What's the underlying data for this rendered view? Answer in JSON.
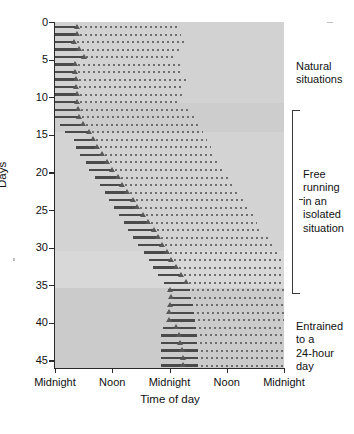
{
  "chart_data": {
    "type": "actogram",
    "title": "",
    "xlabel": "Time of day",
    "ylabel": "Days",
    "xlim": [
      0,
      48
    ],
    "ylim": [
      0,
      46
    ],
    "grid": false,
    "legend": "none",
    "x_tick_values": [
      0,
      12,
      24,
      36,
      48
    ],
    "x_tick_labels": [
      "Midnight",
      "Noon",
      "Midnight",
      "Noon",
      "Midnight"
    ],
    "y_tick_values": [
      0,
      5,
      10,
      15,
      20,
      25,
      30,
      35,
      40,
      45
    ],
    "y_tick_labels": [
      "0",
      "5",
      "10",
      "15",
      "20",
      "25",
      "30",
      "35",
      "40",
      "45"
    ],
    "series_description": "Double-plotted actogram: each row is one day. Solid bar = consolidated sleep bout, triangle = sleep onset marker, dotted bar = rest/activity continuation.",
    "rows": [
      {
        "day": 0,
        "solid_start": 0.0,
        "solid_end": 4.6,
        "marker": 4.6,
        "dots_start": 5.2,
        "dots_end": 25.8
      },
      {
        "day": 1,
        "solid_start": 0.0,
        "solid_end": 4.6,
        "marker": 4.6,
        "dots_start": 5.2,
        "dots_end": 26.4
      },
      {
        "day": 2,
        "solid_start": 0.0,
        "solid_end": 4.0,
        "marker": 4.0,
        "dots_start": 4.6,
        "dots_end": 27.0
      },
      {
        "day": 3,
        "solid_start": 0.0,
        "solid_end": 5.0,
        "marker": 5.0,
        "dots_start": 5.6,
        "dots_end": 26.0
      },
      {
        "day": 4,
        "solid_start": 0.0,
        "solid_end": 6.0,
        "marker": 6.0,
        "dots_start": 6.6,
        "dots_end": 25.4
      },
      {
        "day": 5,
        "solid_start": 0.0,
        "solid_end": 4.2,
        "marker": 4.2,
        "dots_start": 4.8,
        "dots_end": 26.2
      },
      {
        "day": 6,
        "solid_start": 0.0,
        "solid_end": 4.2,
        "marker": 4.2,
        "dots_start": 4.8,
        "dots_end": 26.8
      },
      {
        "day": 7,
        "solid_start": 0.0,
        "solid_end": 4.4,
        "marker": 4.4,
        "dots_start": 5.0,
        "dots_end": 27.4
      },
      {
        "day": 8,
        "solid_start": 0.0,
        "solid_end": 4.4,
        "marker": 4.4,
        "dots_start": 5.0,
        "dots_end": 27.0
      },
      {
        "day": 9,
        "solid_start": 0.0,
        "solid_end": 4.6,
        "marker": 4.6,
        "dots_start": 5.2,
        "dots_end": 26.6
      },
      {
        "day": 10,
        "solid_start": 0.0,
        "solid_end": 4.6,
        "marker": 4.6,
        "dots_start": 5.2,
        "dots_end": 26.0
      },
      {
        "day": 11,
        "solid_start": 0.0,
        "solid_end": 4.8,
        "marker": 4.8,
        "dots_start": 5.4,
        "dots_end": 28.4
      },
      {
        "day": 12,
        "solid_start": 0.0,
        "solid_end": 5.0,
        "marker": 5.0,
        "dots_start": 5.6,
        "dots_end": 29.2
      },
      {
        "day": 13,
        "solid_start": 1.0,
        "solid_end": 5.8,
        "marker": 5.8,
        "dots_start": 6.4,
        "dots_end": 30.2
      },
      {
        "day": 14,
        "solid_start": 2.2,
        "solid_end": 7.2,
        "marker": 7.2,
        "dots_start": 7.8,
        "dots_end": 31.0
      },
      {
        "day": 15,
        "solid_start": 4.0,
        "solid_end": 8.0,
        "marker": 8.0,
        "dots_start": 8.6,
        "dots_end": 31.8
      },
      {
        "day": 16,
        "solid_start": 4.4,
        "solid_end": 8.8,
        "marker": 8.8,
        "dots_start": 9.4,
        "dots_end": 32.6
      },
      {
        "day": 17,
        "solid_start": 5.2,
        "solid_end": 9.8,
        "marker": 9.8,
        "dots_start": 10.4,
        "dots_end": 33.6
      },
      {
        "day": 18,
        "solid_start": 6.4,
        "solid_end": 11.0,
        "marker": 11.0,
        "dots_start": 11.6,
        "dots_end": 34.4
      },
      {
        "day": 19,
        "solid_start": 7.2,
        "solid_end": 12.0,
        "marker": 12.0,
        "dots_start": 12.6,
        "dots_end": 35.6
      },
      {
        "day": 20,
        "solid_start": 8.4,
        "solid_end": 13.2,
        "marker": 13.2,
        "dots_start": 13.8,
        "dots_end": 36.6
      },
      {
        "day": 21,
        "solid_start": 9.4,
        "solid_end": 14.0,
        "marker": 14.0,
        "dots_start": 14.6,
        "dots_end": 37.6
      },
      {
        "day": 22,
        "solid_start": 10.4,
        "solid_end": 15.2,
        "marker": 15.2,
        "dots_start": 15.8,
        "dots_end": 38.6
      },
      {
        "day": 23,
        "solid_start": 11.4,
        "solid_end": 16.4,
        "marker": 16.4,
        "dots_start": 17.0,
        "dots_end": 39.6
      },
      {
        "day": 24,
        "solid_start": 12.4,
        "solid_end": 17.2,
        "marker": 17.2,
        "dots_start": 17.8,
        "dots_end": 40.4
      },
      {
        "day": 25,
        "solid_start": 13.4,
        "solid_end": 18.4,
        "marker": 18.4,
        "dots_start": 19.0,
        "dots_end": 41.4
      },
      {
        "day": 26,
        "solid_start": 14.4,
        "solid_end": 19.6,
        "marker": 19.6,
        "dots_start": 20.2,
        "dots_end": 42.4
      },
      {
        "day": 27,
        "solid_start": 15.4,
        "solid_end": 20.8,
        "marker": 20.8,
        "dots_start": 21.4,
        "dots_end": 43.4
      },
      {
        "day": 28,
        "solid_start": 16.4,
        "solid_end": 21.6,
        "marker": 21.6,
        "dots_start": 22.2,
        "dots_end": 44.6
      },
      {
        "day": 29,
        "solid_start": 17.4,
        "solid_end": 22.4,
        "marker": 22.4,
        "dots_start": 23.0,
        "dots_end": 45.6
      },
      {
        "day": 30,
        "solid_start": 18.6,
        "solid_end": 23.4,
        "marker": 23.4,
        "dots_start": 24.0,
        "dots_end": 46.6
      },
      {
        "day": 31,
        "solid_start": 19.6,
        "solid_end": 24.4,
        "marker": 24.4,
        "dots_start": 25.0,
        "dots_end": 47.4
      },
      {
        "day": 32,
        "solid_start": 20.6,
        "solid_end": 25.4,
        "marker": 25.4,
        "dots_start": 26.0,
        "dots_end": 48.0
      },
      {
        "day": 33,
        "solid_start": 21.6,
        "solid_end": 26.4,
        "marker": 26.4,
        "dots_start": 27.0,
        "dots_end": 48.0
      },
      {
        "day": 34,
        "solid_start": 22.8,
        "solid_end": 27.4,
        "marker": 27.4,
        "dots_start": 28.0,
        "dots_end": 48.0
      },
      {
        "day": 35,
        "solid_start": 23.6,
        "solid_end": 28.2,
        "marker": 24.2,
        "dots_start": 28.8,
        "dots_end": 48.0
      },
      {
        "day": 36,
        "solid_start": 23.8,
        "solid_end": 28.6,
        "marker": 24.4,
        "dots_start": 29.2,
        "dots_end": 48.0
      },
      {
        "day": 37,
        "solid_start": 23.8,
        "solid_end": 29.0,
        "marker": 24.2,
        "dots_start": 29.6,
        "dots_end": 48.0
      },
      {
        "day": 38,
        "solid_start": 23.6,
        "solid_end": 29.2,
        "marker": 24.0,
        "dots_start": 29.8,
        "dots_end": 48.0
      },
      {
        "day": 39,
        "solid_start": 23.6,
        "solid_end": 29.4,
        "marker": 24.0,
        "dots_start": 30.0,
        "dots_end": 48.0
      },
      {
        "day": 40,
        "solid_start": 22.6,
        "solid_end": 29.6,
        "marker": 25.4,
        "dots_start": 30.2,
        "dots_end": 48.0
      },
      {
        "day": 41,
        "solid_start": 22.2,
        "solid_end": 29.8,
        "marker": 26.0,
        "dots_start": 30.4,
        "dots_end": 48.0
      },
      {
        "day": 42,
        "solid_start": 22.2,
        "solid_end": 29.8,
        "marker": 26.2,
        "dots_start": 30.4,
        "dots_end": 48.0
      },
      {
        "day": 43,
        "solid_start": 22.2,
        "solid_end": 30.0,
        "marker": 26.6,
        "dots_start": 30.6,
        "dots_end": 48.0
      },
      {
        "day": 44,
        "solid_start": 22.2,
        "solid_end": 30.0,
        "marker": 26.8,
        "dots_start": 30.6,
        "dots_end": 48.0
      },
      {
        "day": 45,
        "solid_start": 22.2,
        "solid_end": 30.0,
        "marker": 26.8,
        "dots_start": 30.6,
        "dots_end": 48.0
      }
    ],
    "bands": [
      {
        "name": "natural-band",
        "day_start": 0.0,
        "day_end": 10.8,
        "shade": "#d2d2d2"
      },
      {
        "name": "free-band-upper",
        "day_start": 10.8,
        "day_end": 14.6,
        "shade": "#cdcdcd"
      },
      {
        "name": "free-band-mid",
        "day_start": 14.6,
        "day_end": 30.4,
        "shade": "#d3d3d3"
      },
      {
        "name": "free-band-lower",
        "day_start": 30.4,
        "day_end": 35.4,
        "shade": "#d8d8d8"
      },
      {
        "name": "entrained-band",
        "day_start": 35.4,
        "day_end": 46.0,
        "shade": "#cbcbcb"
      }
    ],
    "annotations": [
      {
        "name": "natural-situations",
        "text": "Natural\nsituations",
        "lines": [
          "Natural",
          "situations"
        ]
      },
      {
        "name": "free-running",
        "text": "Free running in an isolated situation",
        "lines": [
          "Free",
          "running",
          "in an",
          "isolated",
          "situation"
        ]
      },
      {
        "name": "entrained-24-hour",
        "text": "Entrained to a 24-hour day",
        "lines": [
          "Entrained",
          "to a",
          "24-hour",
          "day"
        ]
      }
    ],
    "bracket": {
      "name": "free-running-bracket",
      "day_start": 11.4,
      "day_end": 34.8
    }
  },
  "labels": {
    "y_axis_title": "Days",
    "x_axis_title": "Time of day",
    "natural_line1": "Natural",
    "natural_line2": "situations",
    "free_line1": "Free",
    "free_line2": "running",
    "free_line3": "in an",
    "free_line4": "isolated",
    "free_line5": "situation",
    "entr_line1": "Entrained",
    "entr_line2": "to a",
    "entr_line3": "24-hour",
    "entr_line4": "day"
  },
  "colors": {
    "plot_background": "#d2d2d2",
    "solid_bar": "#4a4a4a",
    "dotted_bar": "#6e6e6e",
    "marker": "#585858",
    "axis": "#2a2a2a",
    "text": "#111111"
  }
}
